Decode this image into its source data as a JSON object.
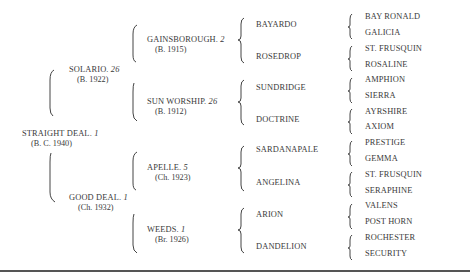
{
  "pedigree": {
    "subject": {
      "name": "STRAIGHT DEAL.",
      "number": "1",
      "detail": "(B. C. 1940)"
    },
    "parents": [
      {
        "name": "SOLARIO.",
        "number": "26",
        "detail": "(B. 1922)"
      },
      {
        "name": "GOOD DEAL.",
        "number": "1",
        "detail": "(Ch. 1932)"
      }
    ],
    "grandparents": [
      {
        "name": "GAINSBOROUGH.",
        "number": "2",
        "detail": "(B. 1915)"
      },
      {
        "name": "SUN WORSHIP.",
        "number": "26",
        "detail": "(B. 1912)"
      },
      {
        "name": "APELLE.",
        "number": "5",
        "detail": "(Ch. 1923)"
      },
      {
        "name": "WEEDS.",
        "number": "1",
        "detail": "(Br. 1926)"
      }
    ],
    "great_grandparents": [
      "BAYARDO",
      "ROSEDROP",
      "SUNDRIDGE",
      "DOCTRINE",
      "SARDANAPALE",
      "ANGELINA",
      "ARION",
      "DANDELION"
    ],
    "great_great_grandparents": [
      "BAY RONALD",
      "GALICIA",
      "ST. FRUSQUIN",
      "ROSALINE",
      "AMPHION",
      "SIERRA",
      "AYRSHIRE",
      "AXIOM",
      "PRESTIGE",
      "GEMMA",
      "ST. FRUSQUIN",
      "SERAPHINE",
      "VALENS",
      "POST HORN",
      "ROCHESTER",
      "SECURITY"
    ]
  },
  "colors": {
    "text": "#3a3a3a",
    "rule": "#555555",
    "background": "#ffffff"
  }
}
